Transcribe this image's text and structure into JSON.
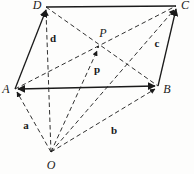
{
  "figure": {
    "type": "vector-geometry-diagram",
    "width": 194,
    "height": 174,
    "background_color": "#fdfdfc",
    "stroke_color": "#1a1a1a",
    "points": {
      "A": {
        "x": 15,
        "y": 89,
        "label": "A",
        "label_x": 6,
        "label_y": 89
      },
      "B": {
        "x": 158,
        "y": 86,
        "label": "B",
        "label_x": 167,
        "label_y": 89
      },
      "C": {
        "x": 176,
        "y": 6,
        "label": "C",
        "label_x": 185,
        "label_y": 5
      },
      "D": {
        "x": 46,
        "y": 7,
        "label": "D",
        "label_x": 37,
        "label_y": 5
      },
      "O": {
        "x": 51,
        "y": 152,
        "label": "O",
        "label_x": 51,
        "label_y": 165
      },
      "P": {
        "x": 98,
        "y": 47,
        "label": "P",
        "label_x": 103,
        "label_y": 33
      }
    },
    "solid_edges": [
      {
        "name": "edge-D-C",
        "from": "D",
        "to": "C",
        "arrow": "none"
      },
      {
        "name": "edge-A-B",
        "from": "A",
        "to": "B",
        "arrow": "both"
      },
      {
        "name": "edge-A-D",
        "from": "A",
        "to": "D",
        "arrow": "end"
      },
      {
        "name": "edge-B-C",
        "from": "B",
        "to": "C",
        "arrow": "end"
      }
    ],
    "dashed_edges": [
      {
        "name": "vector-O-A",
        "from": "O",
        "to": "A",
        "arrow": "end"
      },
      {
        "name": "vector-O-B",
        "from": "O",
        "to": "B",
        "arrow": "end"
      },
      {
        "name": "vector-O-C",
        "from": "O",
        "to": "C",
        "arrow": "end"
      },
      {
        "name": "vector-O-D",
        "from": "O",
        "to": "D",
        "arrow": "end"
      },
      {
        "name": "vector-O-P",
        "from": "O",
        "to": "P",
        "arrow": "end"
      },
      {
        "name": "diagonal-A-C",
        "from": "A",
        "to": "C",
        "arrow": "none"
      },
      {
        "name": "diagonal-D-B",
        "from": "D",
        "to": "B",
        "arrow": "none"
      }
    ],
    "vector_labels": {
      "a": {
        "text": "a",
        "x": 26,
        "y": 125
      },
      "b": {
        "text": "b",
        "x": 114,
        "y": 130
      },
      "c": {
        "text": "c",
        "x": 157,
        "y": 43
      },
      "d": {
        "text": "d",
        "x": 53,
        "y": 38
      },
      "p": {
        "text": "p",
        "x": 97,
        "y": 69
      }
    }
  }
}
